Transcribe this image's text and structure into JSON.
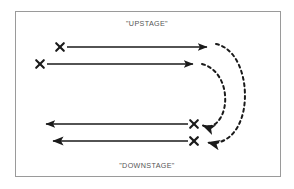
{
  "diagram": {
    "title_top": "\"UPSTAGE\"",
    "title_bottom": "\"DOWNSTAGE\"",
    "frame": {
      "x": 15,
      "y": 11,
      "width": 266,
      "height": 166,
      "border_color": "#9a9a9a",
      "background": "#ffffff"
    },
    "colors": {
      "stroke": "#1a1a1a",
      "label_text": "#555555",
      "border": "#9a9a9a",
      "page_background": "#ffffff"
    },
    "markers": [
      {
        "name": "x-mark-upstage-upper",
        "label": "X",
        "x": 60,
        "y": 47
      },
      {
        "name": "x-mark-upstage-lower",
        "label": "X",
        "x": 40,
        "y": 64
      },
      {
        "name": "x-mark-downstage-upper",
        "label": "X",
        "x": 194,
        "y": 124
      },
      {
        "name": "x-mark-downstage-lower",
        "label": "X",
        "x": 194,
        "y": 141
      }
    ],
    "solid_arrows": [
      {
        "name": "arrow-upstage-upper",
        "direction": "right",
        "from_x": 67,
        "from_y": 47,
        "to_x": 212,
        "to_y": 47
      },
      {
        "name": "arrow-upstage-lower",
        "direction": "right",
        "from_x": 47,
        "from_y": 64,
        "to_x": 198,
        "to_y": 64
      },
      {
        "name": "arrow-downstage-upper",
        "direction": "left",
        "from_x": 188,
        "from_y": 124,
        "to_x": 41,
        "to_y": 124
      },
      {
        "name": "arrow-downstage-lower",
        "direction": "left",
        "from_x": 188,
        "from_y": 141,
        "to_x": 48,
        "to_y": 141
      }
    ],
    "dashed_arcs": [
      {
        "name": "dashed-arc-outer",
        "path": "M 216 45 C 243 50 250 96 240 122 C 233 139 218 144 205 142",
        "arrow_at": "end",
        "arrow_direction": "left",
        "dash": "3 3.4"
      },
      {
        "name": "dashed-arc-inner",
        "path": "M 202 64 C 224 70 229 100 221 117 C 216 126 207 127 200 125",
        "arrow_at": "end",
        "arrow_direction": "left",
        "dash": "3 3.4"
      }
    ],
    "legend": {
      "marker_meaning": "X",
      "solid_line_meaning": "solid arrow",
      "dashed_line_meaning": "dashed arc arrow"
    }
  }
}
